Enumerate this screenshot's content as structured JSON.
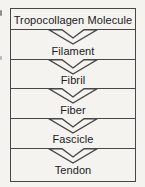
{
  "diagram": {
    "type": "hierarchy-flow",
    "levels": [
      {
        "label": "Tropocollagen Molecule"
      },
      {
        "label": "Filament"
      },
      {
        "label": "Fibril"
      },
      {
        "label": "Fiber"
      },
      {
        "label": "Fascicle"
      },
      {
        "label": "Tendon"
      }
    ],
    "connector": "chevron-down-arrow",
    "colors": {
      "paper": "#f4f3f0",
      "line": "#474747",
      "text": "#202020"
    }
  }
}
